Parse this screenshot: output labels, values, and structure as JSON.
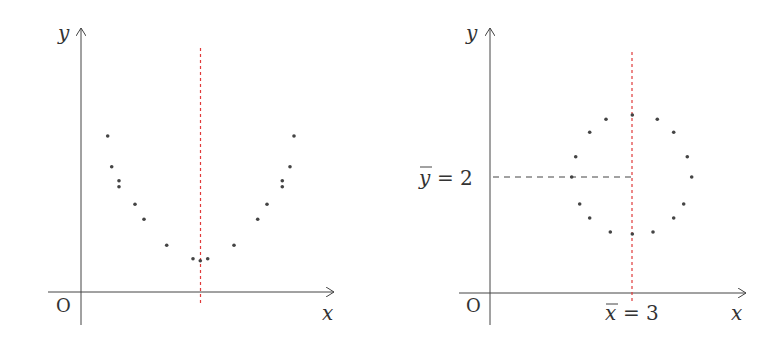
{
  "chart_data": [
    {
      "type": "scatter",
      "title": "",
      "xlabel": "x",
      "ylabel": "y",
      "origin_label": "O",
      "annotations": [
        "vertical red dashed line at mean x"
      ],
      "grid": false,
      "points_px": [
        [
          107.7,
          136
        ],
        [
          111.7,
          166.7
        ],
        [
          119,
          180.7
        ],
        [
          119,
          186.7
        ],
        [
          135,
          204.3
        ],
        [
          144,
          219.3
        ],
        [
          166.7,
          245.3
        ],
        [
          193,
          258.7
        ],
        [
          200.3,
          260.7
        ],
        [
          207.7,
          258.7
        ],
        [
          234,
          245.3
        ],
        [
          257.7,
          219.3
        ],
        [
          267,
          204.3
        ],
        [
          282.3,
          180.7
        ],
        [
          282.3,
          186.7
        ],
        [
          290,
          166.7
        ],
        [
          294,
          136
        ]
      ],
      "mean_line_x_px": 200.5
    },
    {
      "type": "scatter",
      "title": "",
      "xlabel": "x",
      "ylabel": "y",
      "origin_label": "O",
      "x_mean_label": "x̄ = 3",
      "y_mean_label": "ȳ = 2",
      "x_mean": 3,
      "y_mean": 2,
      "grid": false,
      "points_px": [
        [
          606,
          119.3
        ],
        [
          632.3,
          115
        ],
        [
          657.3,
          119.3
        ],
        [
          589.7,
          132.3
        ],
        [
          673.7,
          132.3
        ],
        [
          575.7,
          156.7
        ],
        [
          687.3,
          156.7
        ],
        [
          571.7,
          177
        ],
        [
          691.7,
          177
        ],
        [
          579.7,
          204
        ],
        [
          683.7,
          204
        ],
        [
          589.7,
          218
        ],
        [
          673.7,
          218
        ],
        [
          610.3,
          232
        ],
        [
          632.3,
          234
        ],
        [
          653,
          232
        ]
      ],
      "mean_line_x_px": 632
    }
  ],
  "left": {
    "y_axis_label": "y",
    "x_axis_label": "x",
    "origin_label": "O"
  },
  "right": {
    "y_axis_label": "y",
    "x_axis_label": "x",
    "origin_label": "O",
    "ybar_symbol": "y",
    "ybar_value": "= 2",
    "xbar_symbol": "x",
    "xbar_value": "= 3"
  },
  "colors": {
    "axis": "#444444",
    "dot": "#444444",
    "mean_line": "#e03a3a",
    "dashed_guide": "#444444"
  }
}
